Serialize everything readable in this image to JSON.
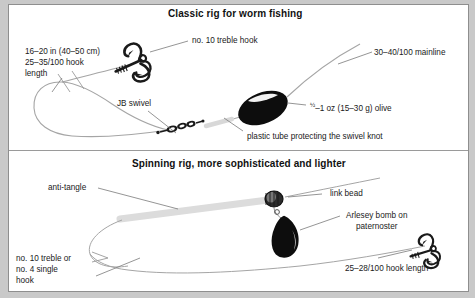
{
  "figure": {
    "kind": "fishing-rig-diagram",
    "panels": [
      {
        "id": "classic",
        "title": "Classic rig for worm fishing",
        "labels": [
          {
            "name": "hook-length-label",
            "text": "16–20 in (40–50 cm)\n25–35/100 hook\nlength"
          },
          {
            "name": "treble-hook-label",
            "text": "no. 10 treble hook"
          },
          {
            "name": "mainline-label",
            "text": "30–40/100 mainline"
          },
          {
            "name": "swivel-label",
            "text": "JB swivel"
          },
          {
            "name": "olive-weight-label",
            "text": "½–1 oz (15–30 g) olive"
          },
          {
            "name": "plastic-tube-label",
            "text": "plastic tube protecting the swivel knot"
          }
        ]
      },
      {
        "id": "spinning",
        "title": "Spinning rig, more sophisticated and lighter",
        "labels": [
          {
            "name": "anti-tangle-label",
            "text": "anti-tangle"
          },
          {
            "name": "link-bead-label",
            "text": "link bead"
          },
          {
            "name": "arlesey-bomb-label",
            "text": "Arlesey bomb on\npaternoster"
          },
          {
            "name": "hook-choice-label",
            "text": "no. 10 treble or\nno. 4 single\nhook"
          },
          {
            "name": "hook-length-label-2",
            "text": "25–28/100 hook length"
          }
        ]
      }
    ]
  },
  "classic": {
    "title": "Classic rig for worm fishing",
    "hook_length_line1": "16–20 in (40–50 cm)",
    "hook_length_line2": "25–35/100 hook",
    "hook_length_line3": "length",
    "treble_hook": "no. 10 treble hook",
    "mainline": "30–40/100 mainline",
    "swivel": "JB swivel",
    "olive_fraction": "½",
    "olive_rest": "–1 oz (15–30 g) olive",
    "plastic_tube": "plastic tube protecting the swivel knot"
  },
  "spinning": {
    "title": "Spinning rig, more sophisticated and lighter",
    "anti_tangle": "anti-tangle",
    "link_bead": "link bead",
    "arlesey_line1": "Arlesey bomb on",
    "arlesey_line2": "paternoster",
    "hook_choice_line1": "no. 10 treble or",
    "hook_choice_line2": "no. 4 single",
    "hook_choice_line3": "hook",
    "hook_length": "25–28/100 hook length"
  },
  "colors": {
    "page_background": "#ffffff",
    "frame": "#c9c9c9",
    "frame_border": "#8e8e8e",
    "text": "#1a1a1a",
    "title_text": "#111111",
    "line": "#9a9a9a",
    "leader_line": "#6e6e6e",
    "weight_fill": "#0d0d0d",
    "tube_fill": "#d8d8d8"
  }
}
